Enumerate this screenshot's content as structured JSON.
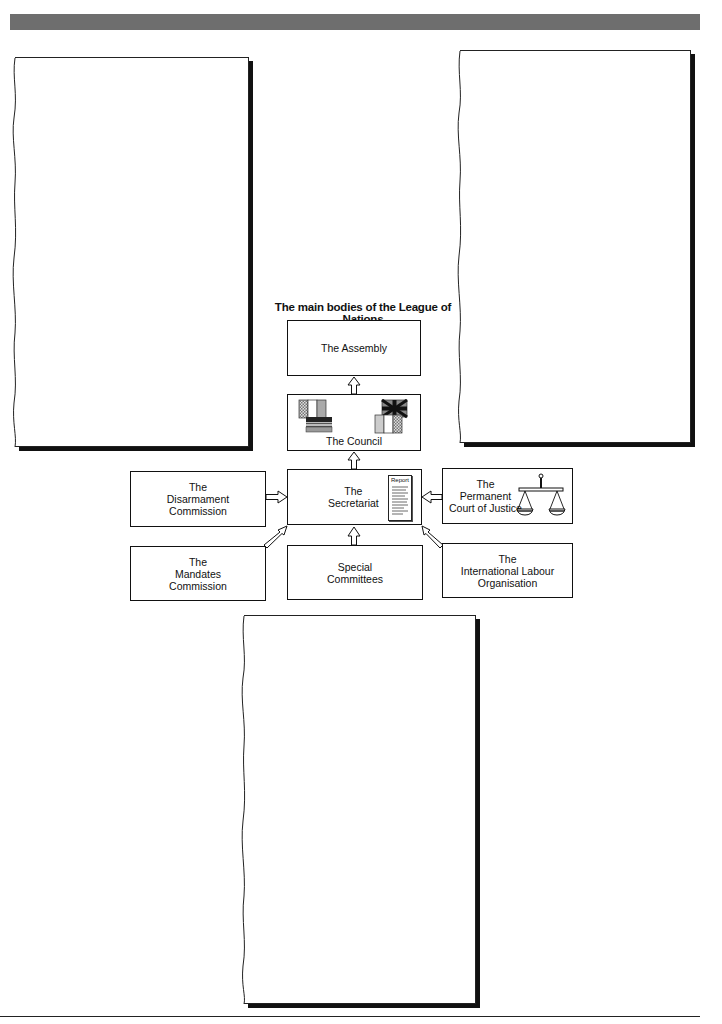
{
  "diagram": {
    "title": "The main bodies of the League of Nations",
    "boxes": {
      "assembly": "The Assembly",
      "council": "The Council",
      "secretariat": "The\nSecretariat",
      "report_label": "Report",
      "disarmament": "The\nDisarmament\nCommission",
      "court": "The\nPermanent\nCourt of Justice",
      "mandates": "The\nMandates\nCommission",
      "special": "Special\nCommittees",
      "ilo": "The\nInternational Labour\nOrganisation"
    },
    "icons": {
      "council_left": "flags-icon",
      "council_right": "union-jack-flags-icon",
      "secretariat": "report-document-icon",
      "court": "scales-of-justice-icon"
    }
  },
  "panels": [
    "left-blank-panel",
    "right-blank-panel",
    "bottom-blank-panel"
  ],
  "colors": {
    "header_bar": "#6e6e6e",
    "ink": "#111111"
  }
}
